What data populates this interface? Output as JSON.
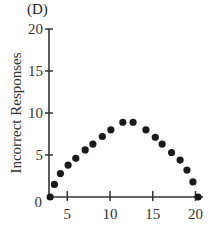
{
  "panel_label": "(D)",
  "chart_data": {
    "type": "scatter",
    "title": "(D)",
    "xlabel": "",
    "ylabel": "Incorrect Responses",
    "xlim": [
      3,
      21
    ],
    "ylim": [
      0,
      20
    ],
    "x_ticks": [
      5,
      10,
      15,
      20
    ],
    "y_ticks": [
      0,
      5,
      10,
      15,
      20
    ],
    "grid": false,
    "legend": null,
    "series": [
      {
        "name": "Incorrect Responses",
        "x": [
          3,
          3.5,
          4.2,
          5.1,
          6,
          7.1,
          8,
          9.1,
          10.1,
          11.5,
          12.7,
          14.2,
          15.3,
          16.1,
          17.2,
          18.2,
          19,
          19.7,
          20.3
        ],
        "values": [
          0,
          1.5,
          2.8,
          3.8,
          4.6,
          5.6,
          6.3,
          7.2,
          8.0,
          8.9,
          8.9,
          8.0,
          7.1,
          6.3,
          5.3,
          4.4,
          3.2,
          1.8,
          0
        ]
      }
    ]
  },
  "axis": {
    "x_tick_labels": [
      "5",
      "10",
      "15",
      "20"
    ],
    "y_tick_labels": [
      "0",
      "5",
      "10",
      "15",
      "20"
    ]
  },
  "colors": {
    "points": "#1a1a1a",
    "axes": "#333333"
  }
}
